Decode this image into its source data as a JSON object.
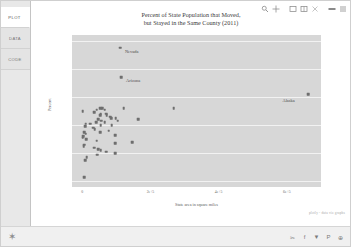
{
  "sidebar": {
    "tabs": [
      {
        "label": "PLOT",
        "active": true
      },
      {
        "label": "DATA",
        "active": false
      },
      {
        "label": "CODE",
        "active": false
      }
    ]
  },
  "toolbar": {
    "items": [
      {
        "name": "zoom-icon",
        "label": "Zoom"
      },
      {
        "name": "pan-move-icon",
        "label": "Pan"
      },
      {
        "name": "box-select-icon",
        "label": "Box Select"
      },
      {
        "name": "lasso-select-icon",
        "label": "Lasso Select"
      },
      {
        "name": "close-icon",
        "label": "Close"
      },
      {
        "name": "autoscale-icon",
        "label": "Autoscale"
      },
      {
        "name": "menu-icon",
        "label": "Menu"
      }
    ]
  },
  "chart_data": {
    "type": "scatter",
    "title_line1": "Percent of State Population that Moved,",
    "title_line2": "but Stayed in the Same County (2011)",
    "xlabel": "State area in square miles",
    "ylabel": "Percent",
    "xlim": [
      -30000,
      700000
    ],
    "ylim": [
      5.6,
      16.4
    ],
    "xticks": [
      0,
      200000,
      400000,
      600000
    ],
    "xticklabels": [
      "0",
      "2e+5",
      "4e+5",
      "6e+5"
    ],
    "yticks": [
      6,
      8,
      10,
      12,
      14,
      16
    ],
    "yticklabels": [
      "6",
      "8",
      "10",
      "12",
      "14",
      "16"
    ],
    "grid": "horizontal-white",
    "legend": "none",
    "marker_color": "#6e6e6e",
    "plot_bg": "#d7d7d7",
    "annotations": [
      {
        "label": "Nevada",
        "x": 110567,
        "y": 15.5
      },
      {
        "label": "Arizona",
        "x": 113998,
        "y": 13.4
      },
      {
        "label": "Alaska",
        "x": 663267,
        "y": 12.2
      }
    ],
    "points": [
      {
        "x": 110567,
        "y": 15.5,
        "state": "Nevada"
      },
      {
        "x": 113998,
        "y": 13.4,
        "state": "Arizona"
      },
      {
        "x": 663267,
        "y": 12.2,
        "state": "Alaska"
      },
      {
        "x": 1545,
        "y": 11.0,
        "state": "Rhode Island"
      },
      {
        "x": 57914,
        "y": 11.2,
        "state": "Georgia"
      },
      {
        "x": 121590,
        "y": 11.2,
        "state": "New Mexico"
      },
      {
        "x": 268596,
        "y": 11.2,
        "state": "Texas"
      },
      {
        "x": 53179,
        "y": 11.2,
        "state": "Arkansas"
      },
      {
        "x": 42143,
        "y": 11.1,
        "state": "Tennessee"
      },
      {
        "x": 65498,
        "y": 11.1,
        "state": "Washington"
      },
      {
        "x": 35826,
        "y": 10.9,
        "state": "Indiana"
      },
      {
        "x": 69898,
        "y": 10.8,
        "state": "Oklahoma"
      },
      {
        "x": 54158,
        "y": 10.8,
        "state": "Wisconsin"
      },
      {
        "x": 71298,
        "y": 10.7,
        "state": "Missouri"
      },
      {
        "x": 52420,
        "y": 10.7,
        "state": "Louisiana"
      },
      {
        "x": 82278,
        "y": 10.6,
        "state": "Kansas"
      },
      {
        "x": 84897,
        "y": 10.5,
        "state": "Utah"
      },
      {
        "x": 98379,
        "y": 10.5,
        "state": "Oregon"
      },
      {
        "x": 46923,
        "y": 10.4,
        "state": "Mississippi"
      },
      {
        "x": 163695,
        "y": 10.4,
        "state": "California"
      },
      {
        "x": 104094,
        "y": 10.3,
        "state": "Colorado"
      },
      {
        "x": 56273,
        "y": 10.3,
        "state": "Iowa"
      },
      {
        "x": 40408,
        "y": 10.2,
        "state": "Kentucky"
      },
      {
        "x": 65758,
        "y": 10.2,
        "state": "Florida"
      },
      {
        "x": 10555,
        "y": 10.1,
        "state": "Maryland"
      },
      {
        "x": 24230,
        "y": 10.1,
        "state": "West Virginia"
      },
      {
        "x": 53819,
        "y": 10.0,
        "state": "North Carolina"
      },
      {
        "x": 86936,
        "y": 10.0,
        "state": "Idaho"
      },
      {
        "x": 8723,
        "y": 9.9,
        "state": "New Jersey"
      },
      {
        "x": 32020,
        "y": 9.8,
        "state": "South Carolina"
      },
      {
        "x": 36418,
        "y": 9.7,
        "state": "Ohio"
      },
      {
        "x": 77116,
        "y": 9.6,
        "state": "Nebraska"
      },
      {
        "x": 5543,
        "y": 9.5,
        "state": "Connecticut"
      },
      {
        "x": 52035,
        "y": 9.5,
        "state": "Alabama"
      },
      {
        "x": 9616,
        "y": 9.4,
        "state": "New Hampshire"
      },
      {
        "x": 96714,
        "y": 9.3,
        "state": "Wyoming"
      },
      {
        "x": 2489,
        "y": 9.2,
        "state": "Delaware"
      },
      {
        "x": 1545,
        "y": 9.1,
        "state": "Rhode Island 2"
      },
      {
        "x": 10931,
        "y": 9.0,
        "state": "Massachusetts"
      },
      {
        "x": 42775,
        "y": 8.9,
        "state": "Virginia"
      },
      {
        "x": 147040,
        "y": 8.8,
        "state": "Montana"
      },
      {
        "x": 96716,
        "y": 8.7,
        "state": "Minnesota"
      },
      {
        "x": 5543,
        "y": 8.6,
        "state": "Vermont"
      },
      {
        "x": 3797,
        "y": 8.5,
        "state": "DC"
      },
      {
        "x": 35385,
        "y": 8.4,
        "state": "Maine"
      },
      {
        "x": 46054,
        "y": 8.3,
        "state": "South Dakota"
      },
      {
        "x": 54556,
        "y": 8.2,
        "state": "New York"
      },
      {
        "x": 70698,
        "y": 8.1,
        "state": "North Dakota"
      },
      {
        "x": 96810,
        "y": 8.0,
        "state": "Michigan"
      },
      {
        "x": 44743,
        "y": 7.9,
        "state": "Pennsylvania"
      },
      {
        "x": 13000,
        "y": 7.7,
        "state": "Hawaii"
      },
      {
        "x": 9350,
        "y": 7.5,
        "state": "New Hampshire 2"
      },
      {
        "x": 6500,
        "y": 6.3,
        "state": "Smallest"
      }
    ]
  },
  "watermark": {
    "text": "plotly - data viz graphs"
  },
  "footer": {
    "favorite_icon": "star-icon",
    "social": [
      {
        "name": "link-icon",
        "glyph": "✂"
      },
      {
        "name": "facebook-icon",
        "glyph": "f"
      },
      {
        "name": "twitter-icon",
        "glyph": "▼"
      },
      {
        "name": "pinterest-icon",
        "glyph": "P"
      },
      {
        "name": "google-plus-icon",
        "glyph": "⊕"
      }
    ]
  }
}
